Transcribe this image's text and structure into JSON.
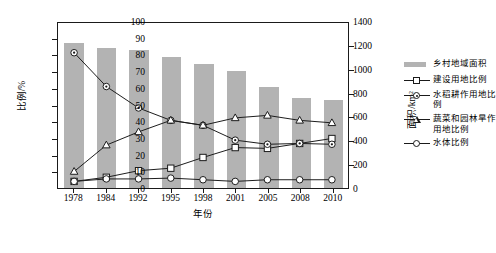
{
  "chart_data": {
    "type": "bar",
    "title": "",
    "xlabel": "年份",
    "ylabel": "比例/%",
    "y2label": "面积/km²",
    "ylim": [
      0,
      100
    ],
    "y2lim": [
      0,
      1400
    ],
    "grid": false,
    "legend_position": "right",
    "categories": [
      "1978",
      "1984",
      "1992",
      "1995",
      "1998",
      "2001",
      "2005",
      "2008",
      "2010"
    ],
    "y_ticks": [
      "0",
      "10",
      "20",
      "30",
      "40",
      "50",
      "60",
      "70",
      "80",
      "90",
      "100"
    ],
    "y2_ticks": [
      "0",
      "200",
      "400",
      "600",
      "800",
      "1000",
      "1200",
      "1400"
    ],
    "series": [
      {
        "name": "乡村地域面积",
        "type": "bar",
        "axis": "right",
        "unit": "km²",
        "marker": "bar",
        "color": "#b3b3b3",
        "values": [
          1218,
          1176,
          1155,
          1099,
          1043,
          980,
          847,
          756,
          735
        ]
      },
      {
        "name": "建设用地比例",
        "type": "line",
        "axis": "left",
        "unit": "%",
        "marker": "square",
        "color": "#1a1a1a",
        "values": [
          4,
          6.5,
          10.5,
          12,
          18.5,
          24.5,
          24,
          27,
          30
        ]
      },
      {
        "name": "水稻耕作用地比例",
        "type": "line",
        "axis": "left",
        "unit": "%",
        "marker": "circle-filled",
        "color": "#1a1a1a",
        "values": [
          82,
          61.5,
          48.5,
          41,
          38,
          29,
          26.5,
          27,
          26.5
        ]
      },
      {
        "name": "蔬菜和园林旱作用地比例",
        "type": "line",
        "axis": "left",
        "unit": "%",
        "marker": "triangle",
        "color": "#1a1a1a",
        "values": [
          10,
          26,
          34,
          41,
          38,
          42.5,
          44,
          41,
          39.5
        ]
      },
      {
        "name": "水体比例",
        "type": "line",
        "axis": "left",
        "unit": "%",
        "marker": "circle",
        "color": "#1a1a1a",
        "values": [
          4,
          5.5,
          5.5,
          6,
          5,
          4,
          5,
          5,
          5
        ]
      }
    ]
  }
}
